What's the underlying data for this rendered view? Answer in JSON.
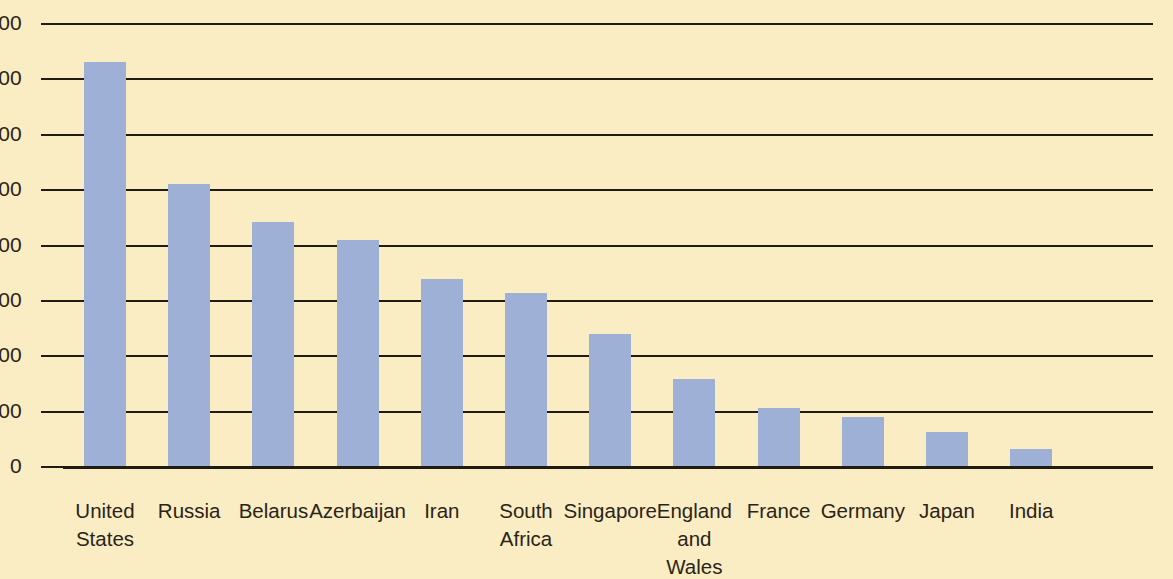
{
  "chart_data": {
    "type": "bar",
    "title": "",
    "xlabel": "",
    "ylabel": "",
    "ylim": [
      0,
      800
    ],
    "ytick_step": 100,
    "yticks": [
      "0",
      "100",
      "200",
      "300",
      "400",
      "500",
      "600",
      "700",
      "800"
    ],
    "grid": "horizontal",
    "legend": "none",
    "bar_color": "#9fb0d6",
    "background_color": "#faedc4",
    "axis_color": "#201c14",
    "categories": [
      "United\nStates",
      "Russia",
      "Belarus",
      "Azerbaijan",
      "Iran",
      "South\nAfrica",
      "Singapore",
      "England\nand\nWales",
      "France",
      "Germany",
      "Japan",
      "India"
    ],
    "values": [
      730,
      510,
      440,
      408,
      337,
      313,
      238,
      158,
      105,
      88,
      61,
      31
    ],
    "series": [
      {
        "name": "",
        "values": [
          730,
          510,
          440,
          408,
          337,
          313,
          238,
          158,
          105,
          88,
          61,
          31
        ]
      }
    ]
  }
}
